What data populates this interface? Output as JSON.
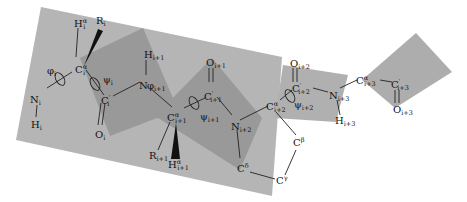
{
  "figure": {
    "type": "polypeptide backbone with peptide planes and dihedral angles",
    "colors": {
      "background": "#ffffff",
      "plane_light": "#b4b4b4",
      "plane_dark": "#959595",
      "bond": "#222222"
    },
    "atoms": {
      "Ni": {
        "main": "N",
        "sub": "i"
      },
      "Hi": {
        "main": "H",
        "sub": "i"
      },
      "Cai": {
        "main": "C",
        "sup": "α",
        "sub": "i"
      },
      "Hai": {
        "main": "H",
        "sup": "α",
        "sub": "i"
      },
      "Ri": {
        "main": "R",
        "sub": "i"
      },
      "Ci": {
        "main": "C",
        "sup": "′",
        "sub": "i"
      },
      "Oi": {
        "main": "O",
        "sub": "i"
      },
      "Ni1": {
        "main": "N",
        "sub": ""
      },
      "Hi1": {
        "main": "H",
        "sub": "i+1"
      },
      "Cai1": {
        "main": "C",
        "sup": "α",
        "sub": "i+1"
      },
      "Ri1": {
        "main": "R",
        "sub": "i+1"
      },
      "Hai1": {
        "main": "H",
        "sup": "α",
        "sub": "i+1"
      },
      "Ci1": {
        "main": "C",
        "sup": "′",
        "sub": "i+1"
      },
      "Oi1": {
        "main": "O",
        "sub": "i+1"
      },
      "Ni2": {
        "main": "N",
        "sub": "i+2"
      },
      "Cai2": {
        "main": "C",
        "sup": "α",
        "sub": "i+2"
      },
      "Cd": {
        "main": "C",
        "sup": "δ"
      },
      "Cg": {
        "main": "C",
        "sup": "γ"
      },
      "Cb": {
        "main": "C",
        "sup": "β"
      },
      "Ci2": {
        "main": "C",
        "sup": "′",
        "sub": "i+2"
      },
      "Oi2": {
        "main": "O",
        "sub": "i+2"
      },
      "Ni3": {
        "main": "N",
        "sub": "i+3"
      },
      "Hi3": {
        "main": "H",
        "sub": "i+3"
      },
      "Cai3": {
        "main": "C",
        "sup": "α",
        "sub": "i+3"
      },
      "Ci3": {
        "main": "C",
        "sup": "′",
        "sub": "i+3"
      },
      "Oi3": {
        "main": "O",
        "sub": "i+3"
      }
    },
    "angles": {
      "phi_i": {
        "main": "φ",
        "sub": "i"
      },
      "psi_i": {
        "main": "ψ",
        "sub": "i"
      },
      "phi_i1": {
        "main": "φ",
        "sub": "i+1"
      },
      "psi_i1": {
        "main": "ψ",
        "sub": "i+1"
      },
      "psi_i2": {
        "main": "ψ",
        "sub": "i+2"
      }
    }
  }
}
